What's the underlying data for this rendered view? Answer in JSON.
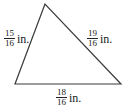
{
  "figure": {
    "type": "triangle",
    "vertices": {
      "top": [
        45,
        4
      ],
      "bottom_left": [
        15,
        84
      ],
      "bottom_right": [
        121,
        84
      ]
    },
    "stroke_color": "#3a3a3a",
    "sides": [
      {
        "id": "left",
        "numerator": "15",
        "denominator": "16",
        "unit": "in."
      },
      {
        "id": "right",
        "numerator": "19",
        "denominator": "16",
        "unit": "in."
      },
      {
        "id": "bottom",
        "numerator": "18",
        "denominator": "16",
        "unit": "in."
      }
    ]
  }
}
